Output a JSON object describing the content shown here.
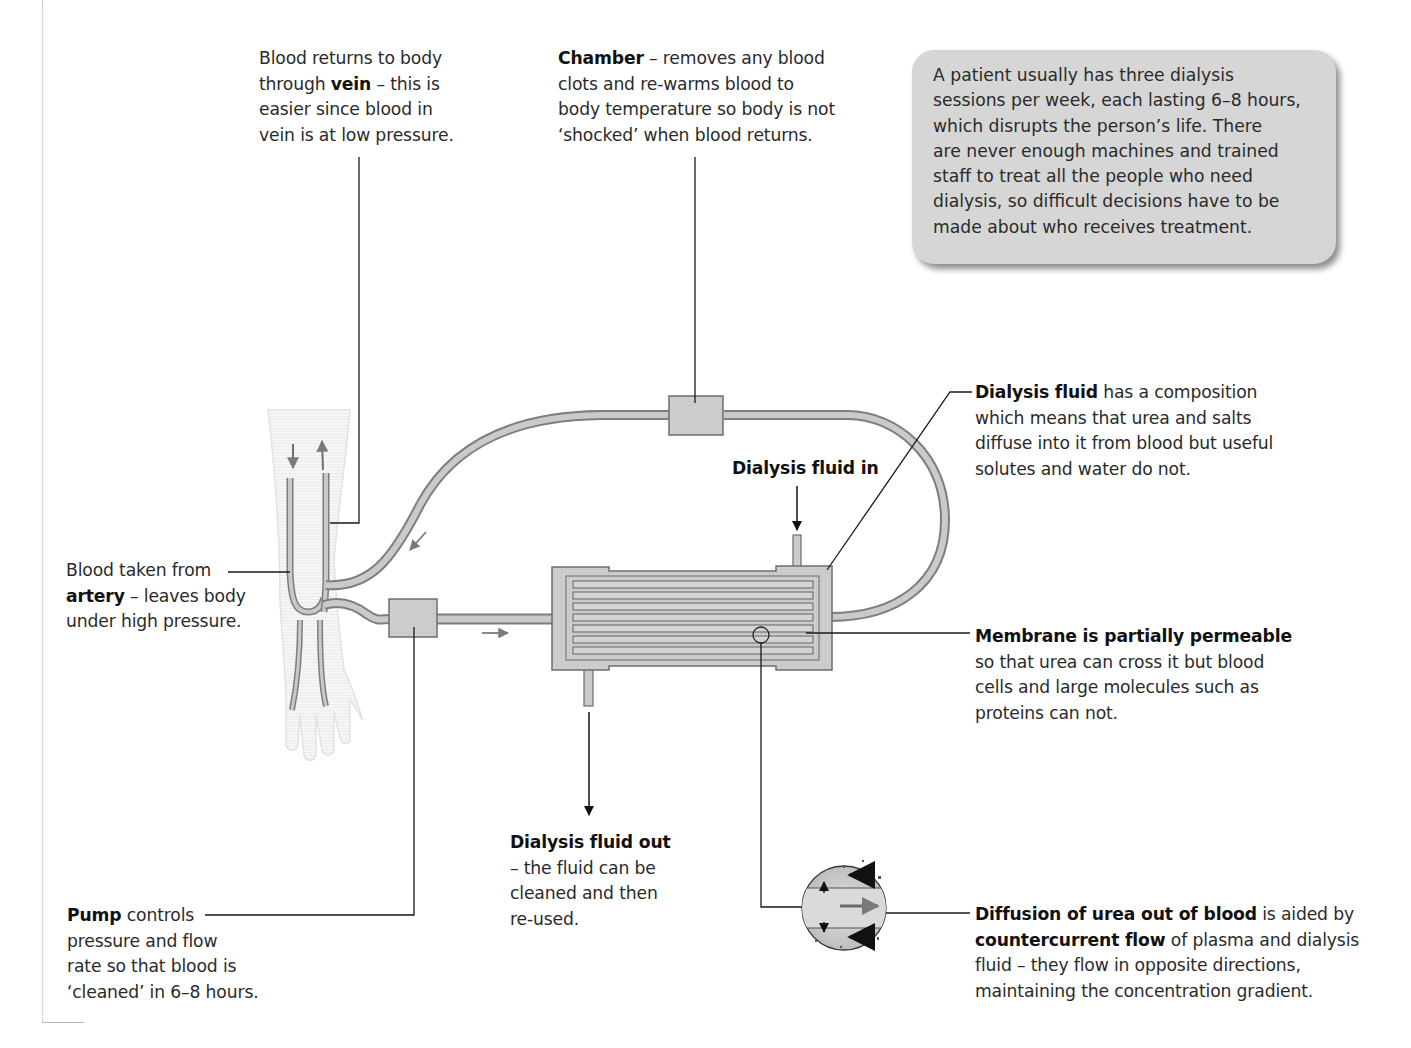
{
  "figure": {
    "colors": {
      "tube_fill": "#c9c9c9",
      "tube_stroke": "#7a7a7a",
      "box_fill": "#cfcfcf",
      "note_bg": "#d6d6d6",
      "text": "#2a2a2a",
      "leader_line": "#1a1a1a"
    }
  },
  "labels": {
    "vein": {
      "line1": "Blood returns to body",
      "line2_pre": "through ",
      "line2_bold": "vein",
      "line2_post": " – this is",
      "line3": "easier since blood in",
      "line4": "vein is at low pressure."
    },
    "chamber": {
      "bold": "Chamber",
      "line1_post": " – removes any blood",
      "line2": "clots and re-warms blood to",
      "line3": "body temperature so body is not",
      "line4": "‘shocked’ when blood returns."
    },
    "note": {
      "text": "A patient usually has three dialysis sessions per week, each lasting 6–8 hours, which disrupts the person’s life. There are never enough machines and trained staff to treat all the people who need dialysis, so difficult decisions have to be made about who receives treatment.",
      "lines": [
        "A patient usually has three dialysis",
        "sessions per week, each lasting 6–8 hours,",
        "which disrupts the person’s life. There",
        "are never enough machines and trained",
        "staff to treat all the people who need",
        "dialysis, so difficult decisions have to be",
        "made about who receives treatment."
      ]
    },
    "dialysis_fluid": {
      "bold": "Dialysis fluid",
      "line1_post": " has a composition",
      "line2": "which means that urea and salts",
      "line3": "diffuse into it from blood but useful",
      "line4": "solutes and water do not."
    },
    "fluid_in": "Dialysis fluid in",
    "artery": {
      "line1": "Blood taken from",
      "line2_bold": "artery",
      "line2_post": " – leaves body",
      "line3": "under high pressure."
    },
    "membrane": {
      "bold": "Membrane is partially permeable",
      "line2": "so that urea can cross it but blood",
      "line3": "cells and large molecules such as",
      "line4": "proteins can not."
    },
    "fluid_out": {
      "bold": "Dialysis fluid out",
      "line2": "– the fluid can be",
      "line3": "cleaned and then",
      "line4": "re-used."
    },
    "pump": {
      "bold": "Pump",
      "line1_post": " controls",
      "line2": "pressure and flow",
      "line3": "rate so that blood is",
      "line4": "‘cleaned’ in 6–8 hours."
    },
    "diffusion": {
      "bold1": "Diffusion of urea out of blood",
      "line1_post": " is aided by",
      "bold2": "countercurrent flow",
      "line2_post": " of plasma and dialysis",
      "line3": "fluid – they flow in opposite directions,",
      "line4": "maintaining the concentration gradient."
    }
  },
  "icons": {
    "flow_arrow": "arrow-icon",
    "magnifier": "magnified-view-circle"
  }
}
